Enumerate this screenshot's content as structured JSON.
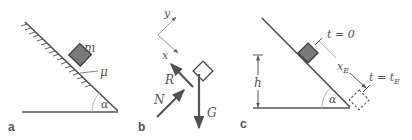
{
  "figure": {
    "panels": [
      {
        "id": "a",
        "label": "a",
        "mass_label": "m",
        "friction_label": "μ",
        "angle_label": "α"
      },
      {
        "id": "b",
        "label": "b",
        "axis_y_label": "y",
        "axis_x_label": "x",
        "force_labels": {
          "R": "R",
          "N": "N",
          "G": "G"
        }
      },
      {
        "id": "c",
        "label": "c",
        "start_label": "t = 0",
        "end_label": "t = t",
        "end_label_sub": "E",
        "distance_label": "x",
        "distance_label_sub": "E",
        "height_label": "h",
        "angle_label": "α"
      }
    ],
    "colors": {
      "line": "#4a4a4a",
      "block_fill": "#7a7a7a",
      "block_stroke": "#3a3a3a",
      "light_line": "#9a9a9a",
      "force_arrow": "#555555",
      "text": "#555555"
    }
  }
}
